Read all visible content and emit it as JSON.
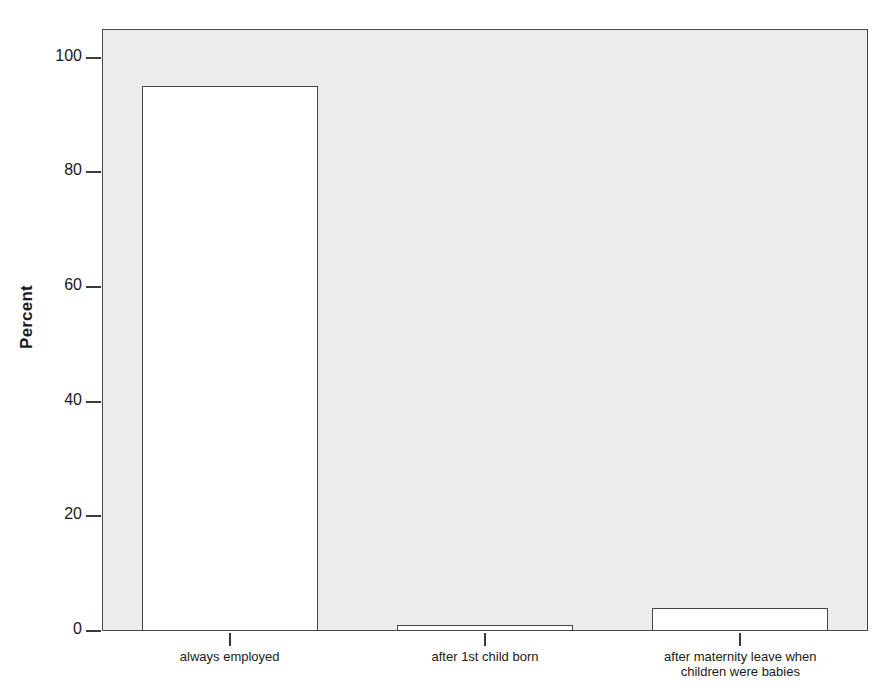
{
  "chart_data": {
    "type": "bar",
    "title": "",
    "subtitle": "",
    "xlabel": "",
    "ylabel": "Percent",
    "categories": [
      "always employed",
      "after 1st child born",
      "after maternity leave when children were babies"
    ],
    "category_lines": [
      [
        "always employed"
      ],
      [
        "after 1st child born"
      ],
      [
        "after maternity leave when",
        "children were babies"
      ]
    ],
    "values": [
      95,
      1,
      4
    ],
    "ylim": [
      0,
      105
    ],
    "yticks": [
      0,
      20,
      40,
      60,
      80,
      100
    ],
    "ytick_labels": [
      "0",
      "20",
      "40",
      "60",
      "80",
      "100"
    ],
    "grid": false,
    "legend": false,
    "legend_position": "none",
    "bar_fill_color": "#ffffff",
    "bar_border_color": "#454545",
    "plot_background_color": "#ececec",
    "page_background_color": "#ffffff",
    "axis_color": "#4a4a4a",
    "text_color": "#1a1a1a"
  }
}
